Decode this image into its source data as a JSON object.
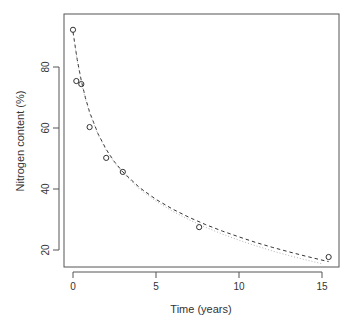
{
  "chart_data": {
    "type": "scatter",
    "title": "",
    "xlabel": "Time (years)",
    "ylabel": "Nitrogen content (%)",
    "xlim": [
      -0.6,
      16.1
    ],
    "ylim": [
      14.5,
      95
    ],
    "xticks": [
      0,
      5,
      10,
      15
    ],
    "yticks": [
      20,
      40,
      60,
      80
    ],
    "grid": false,
    "legend": null,
    "series": [
      {
        "name": "observed",
        "style": "points",
        "marker": "open-circle",
        "x": [
          0,
          0.2,
          0.5,
          1,
          2,
          3,
          7.6,
          15.4
        ],
        "y": [
          92.2,
          75.4,
          74.4,
          60.3,
          50.2,
          45.6,
          27.5,
          17.7
        ]
      },
      {
        "name": "fitted-dashed",
        "style": "dashed-line",
        "x": [
          0,
          0.25,
          0.5,
          0.75,
          1,
          1.5,
          2,
          2.5,
          3,
          4,
          5,
          6,
          7,
          8,
          9,
          10,
          11,
          12,
          13,
          14,
          15,
          15.4
        ],
        "y": [
          91.5,
          82.5,
          75.5,
          69.8,
          65.2,
          58.2,
          53.0,
          48.9,
          45.6,
          40.5,
          36.6,
          33.4,
          30.7,
          28.3,
          26.2,
          24.3,
          22.5,
          20.9,
          19.4,
          18.0,
          16.7,
          16.2
        ]
      },
      {
        "name": "fitted-dotted",
        "style": "dotted-line",
        "x": [
          0,
          0.25,
          0.5,
          0.75,
          1,
          1.5,
          2,
          2.5,
          3,
          4,
          5,
          6,
          7,
          8,
          9,
          10,
          11,
          12,
          13,
          14,
          15
        ],
        "y": [
          91.5,
          82.0,
          75.0,
          69.4,
          64.9,
          57.9,
          52.7,
          48.6,
          45.3,
          40.0,
          36.0,
          32.7,
          29.9,
          27.4,
          25.2,
          23.2,
          21.4,
          19.7,
          18.2,
          16.8,
          15.5
        ]
      }
    ]
  }
}
